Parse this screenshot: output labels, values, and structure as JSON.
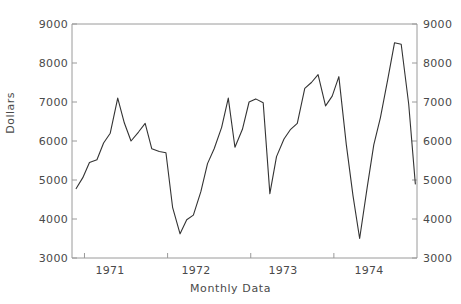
{
  "chart_data": {
    "type": "line",
    "title": "",
    "xlabel": "Monthly Data",
    "ylabel": "Dollars",
    "ylim": [
      3000,
      9000
    ],
    "yticks": [
      3000,
      4000,
      5000,
      6000,
      7000,
      8000,
      9000
    ],
    "ytick_labels_left": [
      "9000",
      "8000",
      "7000",
      "6000",
      "5000",
      "4000",
      "3000"
    ],
    "ytick_labels_right": [
      "9000",
      "8000",
      "7000",
      "6000",
      "5000",
      "4000",
      "3000"
    ],
    "xtick_labels": [
      "1971",
      "1972",
      "1973",
      "1974"
    ],
    "xtick_positions_years": [
      1971,
      1972,
      1973,
      1974
    ],
    "xlim": [
      "1970.85",
      "1975.0"
    ],
    "grid": false,
    "legend": null,
    "line_color": "#333333",
    "axis_color": "#8c8c8c",
    "series": [
      {
        "name": "Dollars",
        "x": [
          "1970.90",
          "1970.98",
          "1971.06",
          "1971.15",
          "1971.23",
          "1971.31",
          "1971.40",
          "1971.48",
          "1971.56",
          "1971.65",
          "1971.73",
          "1971.81",
          "1971.90",
          "1971.98",
          "1972.06",
          "1972.15",
          "1972.23",
          "1972.31",
          "1972.40",
          "1972.48",
          "1972.56",
          "1972.65",
          "1972.73",
          "1972.81",
          "1972.90",
          "1972.98",
          "1973.06",
          "1973.15",
          "1973.23",
          "1973.31",
          "1973.40",
          "1973.48",
          "1973.56",
          "1973.65",
          "1973.73",
          "1973.81",
          "1973.90",
          "1973.98",
          "1974.06",
          "1974.15",
          "1974.23",
          "1974.31",
          "1974.40",
          "1974.48",
          "1974.56",
          "1974.65",
          "1974.73",
          "1974.81",
          "1974.90",
          "1974.98"
        ],
        "values": [
          4780,
          5060,
          5450,
          5520,
          5950,
          6200,
          7100,
          6460,
          6000,
          6230,
          6450,
          5800,
          5730,
          5700,
          4300,
          3620,
          3980,
          4100,
          4700,
          5420,
          5800,
          6350,
          7100,
          5840,
          6300,
          7000,
          7080,
          6980,
          4650,
          5600,
          6050,
          6300,
          6450,
          7350,
          7500,
          7700,
          6900,
          7150,
          7650,
          5900,
          4600,
          3500,
          4800,
          5900,
          6600,
          7600,
          8520,
          8480,
          6950,
          4900
        ]
      }
    ]
  },
  "axis": {
    "ylabel": "Dollars",
    "xlabel": "Monthly Data",
    "y_labels": [
      "9000",
      "8000",
      "7000",
      "6000",
      "5000",
      "4000",
      "3000"
    ],
    "x_labels": [
      "1971",
      "1972",
      "1973",
      "1974"
    ]
  }
}
